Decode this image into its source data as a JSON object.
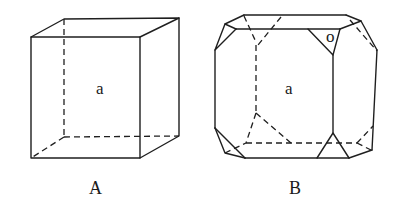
{
  "figures": [
    {
      "id": "A",
      "caption": "A",
      "face_label": "a",
      "description": "Cube"
    },
    {
      "id": "B",
      "caption": "B",
      "face_labels": {
        "cube_face": "a",
        "octahedral_face": "o"
      },
      "description": "Cube truncated by octahedron faces at corners"
    }
  ]
}
